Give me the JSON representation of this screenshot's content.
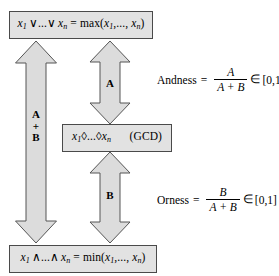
{
  "diagram": {
    "colors": {
      "box_fill": "#e2e2e2",
      "box_border": "#4a4a4a",
      "arrow_fill": "#dcdcdc",
      "arrow_border": "#555555",
      "background": "#ffffff",
      "text": "#000000"
    },
    "nodes": {
      "top": {
        "id": "max-node",
        "text": "x1 ∨...∨ xn = max(x1,..., xn)",
        "parts": {
          "lhs_var": "x",
          "lhs_sub1": "1",
          "lhs_op": "∨...∨",
          "lhs_var2": "x",
          "lhs_sub2": "n",
          "equals": "=",
          "fn": "max",
          "args": "(x1,..., xn)"
        }
      },
      "middle": {
        "id": "gcd-node",
        "text": "x1◊...◊xn",
        "annotation": "(GCD)",
        "parts": {
          "var1": "x",
          "sub1": "1",
          "op": "◊...◊",
          "var2": "x",
          "sub2": "n"
        }
      },
      "bottom": {
        "id": "min-node",
        "text": "x1 ∧...∧ xn = min(x1,..., xn)",
        "parts": {
          "lhs_var": "x",
          "lhs_sub1": "1",
          "lhs_op": "∧...∧",
          "lhs_var2": "x",
          "lhs_sub2": "n",
          "equals": "=",
          "fn": "min",
          "args": "(x1,..., xn)"
        }
      }
    },
    "arrows": [
      {
        "id": "arrow-total",
        "label_lines": [
          "A",
          "+",
          "B"
        ],
        "from": "min-node",
        "to": "max-node",
        "double_headed": true
      },
      {
        "id": "arrow-andness",
        "label_lines": [
          "A"
        ],
        "from": "gcd-node",
        "to": "max-node",
        "double_headed": true
      },
      {
        "id": "arrow-orness",
        "label_lines": [
          "B"
        ],
        "from": "gcd-node",
        "to": "min-node",
        "double_headed": true
      }
    ],
    "formulas": [
      {
        "id": "andness",
        "name": "Andness",
        "equals": "=",
        "numerator": "A",
        "denominator": "A + B",
        "membership": "∈",
        "range": "[0,1]"
      },
      {
        "id": "orness",
        "name": "Orness",
        "equals": "=",
        "numerator": "B",
        "denominator": "A + B",
        "membership": "∈",
        "range": "[0,1]"
      }
    ]
  }
}
